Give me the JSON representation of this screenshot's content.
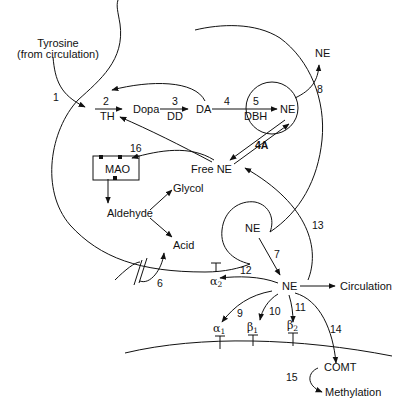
{
  "labels": {
    "tyrosine": "Tyrosine",
    "tyrosine_source": "(from circulation)",
    "dopa": "Dopa",
    "da": "DA",
    "ne_vesicle": "NE",
    "ne_released": "NE",
    "ne_cleft": "NE",
    "ne_recycle": "NE",
    "free_ne": "Free NE",
    "mao": "MAO",
    "aldehyde": "Aldehyde",
    "glycol": "Glycol",
    "acid": "Acid",
    "circulation": "Circulation",
    "comt": "COMT",
    "methylation": "Methylation"
  },
  "enzymes": {
    "th": "TH",
    "dd": "DD",
    "dbh": "DBH"
  },
  "steps": {
    "s1": "1",
    "s2": "2",
    "s3": "3",
    "s4": "4",
    "s4a": "4A",
    "s5": "5",
    "s6": "6",
    "s7": "7",
    "s8": "8",
    "s9": "9",
    "s10": "10",
    "s11": "11",
    "s12": "12",
    "s13": "13",
    "s14": "14",
    "s15": "15",
    "s16": "16"
  },
  "receptors": {
    "alpha2": {
      "symbol": "α",
      "sub": "2"
    },
    "alpha1": {
      "symbol": "α",
      "sub": "1"
    },
    "beta1": {
      "symbol": "β",
      "sub": "1"
    },
    "beta2": {
      "symbol": "β",
      "sub": "2"
    }
  },
  "colors": {
    "line": "#111111",
    "background": "#ffffff"
  }
}
